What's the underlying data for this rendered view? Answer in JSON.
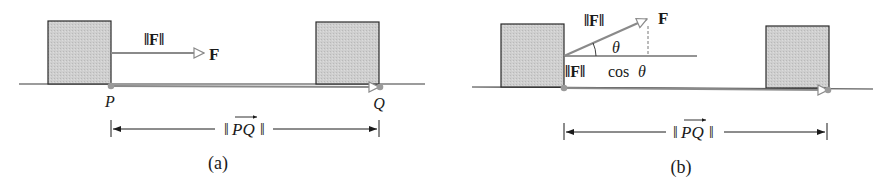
{
  "figure": {
    "panels": [
      {
        "id": "a",
        "caption": "(a)",
        "force_magnitude_label": "‖F‖",
        "force_vector_label": "F",
        "start_point_label": "P",
        "end_point_label": "Q",
        "distance_label": "‖PQ‖",
        "distance_label_parts": {
          "open": "‖",
          "vector": "PQ",
          "close": "‖"
        }
      },
      {
        "id": "b",
        "caption": "(b)",
        "force_magnitude_label": "‖F‖",
        "force_vector_label": "F",
        "angle_label": "θ",
        "component_label": "‖F‖ cos θ",
        "component_label_parts": {
          "norm": "‖F‖",
          "func": "cos",
          "angle": "θ"
        },
        "distance_label": "‖PQ‖",
        "distance_label_parts": {
          "open": "‖",
          "vector": "PQ",
          "close": "‖"
        }
      }
    ],
    "colors": {
      "block_fill": "#c8c8c8",
      "block_stroke": "#2a2a2a",
      "ground": "#3a3a3a",
      "vector": "#8a8a8a",
      "point": "#9a9a9a",
      "text": "#1a1a1a"
    }
  }
}
